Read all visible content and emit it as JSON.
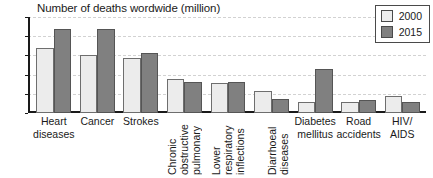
{
  "chart_data": {
    "type": "bar",
    "title": "Number of deaths wordwide (million)",
    "xlabel": "",
    "ylabel": "",
    "ylim": [
      0,
      10
    ],
    "yticks": [
      0,
      2,
      4,
      6,
      8,
      10
    ],
    "grid": true,
    "legend_position": "top-right",
    "categories": [
      "Heart diseases",
      "Cancer",
      "Strokes",
      "Chronic obstructive pulmonary",
      "Lower respiratory inflections",
      "Diarrhoeal diseases",
      "Diabetes mellitus",
      "Road accidents",
      "HIV/ AIDS"
    ],
    "category_labels": [
      {
        "text": "Heart\ndiseases",
        "orientation": "horizontal"
      },
      {
        "text": "Cancer",
        "orientation": "horizontal"
      },
      {
        "text": "Strokes",
        "orientation": "horizontal"
      },
      {
        "text": "Chronic\nobstructive\npulmonary",
        "orientation": "vertical"
      },
      {
        "text": "Lower\nrespiratory\ninflections",
        "orientation": "vertical"
      },
      {
        "text": "Diarrhoeal\ndiseases",
        "orientation": "vertical"
      },
      {
        "text": "Diabetes\nmellitus",
        "orientation": "horizontal"
      },
      {
        "text": "Road\naccidents",
        "orientation": "horizontal"
      },
      {
        "text": "HIV/\nAIDS",
        "orientation": "horizontal"
      }
    ],
    "series": [
      {
        "name": "2000",
        "color": "#ececec",
        "values": [
          6.8,
          6.0,
          5.7,
          3.5,
          3.1,
          2.25,
          1.1,
          1.1,
          1.75
        ]
      },
      {
        "name": "2015",
        "color": "#808080",
        "values": [
          8.75,
          8.8,
          6.25,
          3.2,
          3.2,
          1.45,
          4.6,
          1.4,
          1.15
        ]
      }
    ]
  },
  "legend": {
    "entries": [
      {
        "label": "2000"
      },
      {
        "label": "2015"
      }
    ]
  },
  "colors": {
    "series_2000": "#ececec",
    "series_2015": "#808080",
    "axis": "#1a1a1a",
    "gridline": "#d2d2d2",
    "background": "#ffffff"
  }
}
